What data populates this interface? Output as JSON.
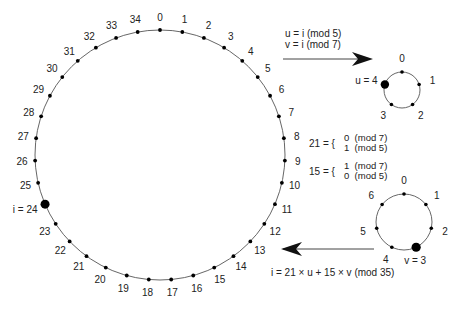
{
  "big_circle": {
    "center": [
      160,
      155
    ],
    "radius": 125,
    "count": 35,
    "labels": [
      "0",
      "1",
      "2",
      "3",
      "4",
      "5",
      "6",
      "7",
      "8",
      "9",
      "10",
      "11",
      "12",
      "13",
      "14",
      "15",
      "16",
      "17",
      "18",
      "19",
      "20",
      "21",
      "22",
      "23",
      "24",
      "25",
      "26",
      "27",
      "28",
      "29",
      "30",
      "31",
      "32",
      "33",
      "34"
    ],
    "highlight_index": 24,
    "highlight_label": "i = 24"
  },
  "mod5_circle": {
    "center": [
      402,
      90
    ],
    "radius": 18,
    "labels": [
      "0",
      "1",
      "2",
      "3",
      "4"
    ],
    "highlight_index": 4,
    "highlight_label": "u = 4"
  },
  "mod7_circle": {
    "center": [
      404,
      222
    ],
    "radius": 28,
    "labels": [
      "0",
      "1",
      "2",
      "3",
      "4",
      "5",
      "6"
    ],
    "highlight_index": 3,
    "highlight_label": "v = 3"
  },
  "top_arrow": {
    "line1": "u = i (mod 5)",
    "line2": "v = i (mod 7)"
  },
  "crt_coefficients": {
    "eq21_lhs": "21 = {",
    "eq21_top": "0  (mod 7)",
    "eq21_bottom": "1  (mod 5)",
    "eq15_lhs": "15 = {",
    "eq15_top": "1  (mod 7)",
    "eq15_bottom": "0  (mod 5)"
  },
  "bottom_arrow": {
    "formula": "i = 21 × u + 15 × v (mod 35)"
  },
  "colors": {
    "line": "#555555",
    "dot": "#000000",
    "text": "#222222"
  }
}
